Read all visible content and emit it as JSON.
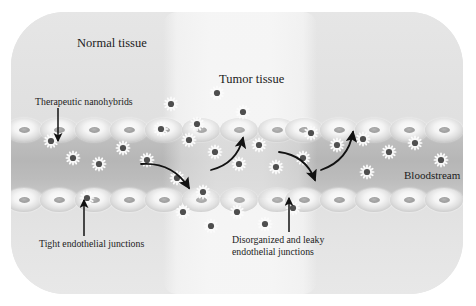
{
  "figure": {
    "panel_bg": "#e3e3e3",
    "lumen_color": "#b6b6b6",
    "tumor_band_color": "#f6f6f6",
    "ink_color": "#1c1c1c"
  },
  "labels": {
    "normal_tissue": "Normal tissue",
    "tumor_tissue": "Tumor tissue",
    "therapeutic_nanohybrids": "Therapeutic nanohybrids",
    "tight_junctions": "Tight endothelial junctions",
    "disorganized_line1": "Disorganized and leaky",
    "disorganized_line2": "endothelial junctions",
    "bloodstream": "Bloodstream"
  },
  "regions": [
    {
      "name": "normal-tissue-left",
      "x": 0,
      "y": 0,
      "width": 152,
      "height": 282
    },
    {
      "name": "tumor-tissue",
      "x": 152,
      "y": 0,
      "width": 154,
      "height": 282
    },
    {
      "name": "normal-tissue-right",
      "x": 306,
      "y": 0,
      "width": 146,
      "height": 282
    },
    {
      "name": "blood-vessel-lumen",
      "x": 0,
      "y": 118,
      "width": 452,
      "height": 68
    }
  ],
  "endothelium": {
    "top_row_y": 106,
    "bottom_row_y": 176,
    "cell_width": 38,
    "cell_height": 24,
    "cell_count_per_row": 13,
    "cell_x_positions": [
      -6,
      29,
      64,
      99,
      134,
      169,
      204,
      239,
      274,
      309,
      344,
      379,
      414
    ],
    "tumor_gap_cells": [
      5,
      6,
      7
    ]
  },
  "nanoparticles": {
    "core_color": "#4f4f4f",
    "spike_color": "#fbfbfb",
    "size": 14,
    "positions": [
      {
        "x": 40,
        "y": 129,
        "region": "lumen"
      },
      {
        "x": 62,
        "y": 146,
        "region": "lumen"
      },
      {
        "x": 88,
        "y": 152,
        "region": "lumen"
      },
      {
        "x": 112,
        "y": 136,
        "region": "lumen"
      },
      {
        "x": 136,
        "y": 148,
        "region": "lumen"
      },
      {
        "x": 76,
        "y": 186,
        "region": "lumen"
      },
      {
        "x": 160,
        "y": 92,
        "region": "tumor-upper"
      },
      {
        "x": 186,
        "y": 112,
        "region": "tumor-upper"
      },
      {
        "x": 206,
        "y": 81,
        "region": "tumor-upper"
      },
      {
        "x": 232,
        "y": 100,
        "region": "tumor-upper"
      },
      {
        "x": 150,
        "y": 117,
        "region": "tumor-upper"
      },
      {
        "x": 178,
        "y": 128,
        "region": "lumen"
      },
      {
        "x": 204,
        "y": 140,
        "region": "lumen"
      },
      {
        "x": 228,
        "y": 152,
        "region": "lumen"
      },
      {
        "x": 248,
        "y": 133,
        "region": "lumen"
      },
      {
        "x": 265,
        "y": 155,
        "region": "lumen"
      },
      {
        "x": 292,
        "y": 146,
        "region": "lumen"
      },
      {
        "x": 166,
        "y": 166,
        "region": "lumen"
      },
      {
        "x": 192,
        "y": 180,
        "region": "tumor-lower"
      },
      {
        "x": 172,
        "y": 200,
        "region": "tumor-lower"
      },
      {
        "x": 200,
        "y": 214,
        "region": "tumor-lower"
      },
      {
        "x": 226,
        "y": 200,
        "region": "tumor-lower"
      },
      {
        "x": 254,
        "y": 212,
        "region": "tumor-lower"
      },
      {
        "x": 282,
        "y": 196,
        "region": "tumor-lower"
      },
      {
        "x": 300,
        "y": 121,
        "region": "tumor-upper"
      },
      {
        "x": 326,
        "y": 133,
        "region": "lumen"
      },
      {
        "x": 352,
        "y": 127,
        "region": "lumen"
      },
      {
        "x": 378,
        "y": 140,
        "region": "lumen"
      },
      {
        "x": 404,
        "y": 131,
        "region": "lumen"
      },
      {
        "x": 430,
        "y": 148,
        "region": "lumen"
      },
      {
        "x": 356,
        "y": 160,
        "region": "lumen"
      }
    ]
  },
  "arrows": [
    {
      "name": "arrow-nanohybrid-pointer",
      "type": "straight",
      "direction": "down",
      "x1": 47,
      "y1": 96,
      "x2": 47,
      "y2": 129
    },
    {
      "name": "arrow-tight-junction-pointer",
      "type": "straight",
      "direction": "up",
      "x1": 73,
      "y1": 224,
      "x2": 73,
      "y2": 188
    },
    {
      "name": "arrow-leaky-junction-pointer",
      "type": "straight",
      "direction": "up",
      "x1": 278,
      "y1": 220,
      "x2": 278,
      "y2": 186
    },
    {
      "name": "arrow-extravasation-down-left",
      "type": "curved",
      "from_x": 130,
      "from_y": 152,
      "to_x": 178,
      "to_y": 176,
      "label": "out of vessel into tumor (lower)"
    },
    {
      "name": "arrow-extravasation-up-left",
      "type": "curved",
      "from_x": 200,
      "from_y": 158,
      "to_x": 232,
      "to_y": 126,
      "label": "out of vessel into tumor (upper)"
    },
    {
      "name": "arrow-extravasation-down-right",
      "type": "curved",
      "from_x": 268,
      "from_y": 140,
      "to_x": 304,
      "to_y": 168,
      "label": "out of vessel into tumor (lower right)"
    },
    {
      "name": "arrow-extravasation-up-right",
      "type": "curved",
      "from_x": 310,
      "from_y": 158,
      "to_x": 342,
      "to_y": 120,
      "label": "circulation back into vessel"
    }
  ]
}
